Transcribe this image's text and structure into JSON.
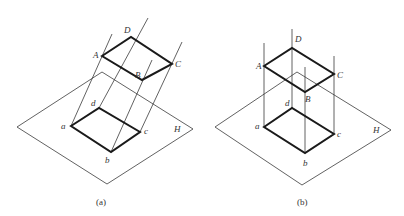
{
  "figures": [
    {
      "id": "a",
      "caption": "(a)",
      "projection": "oblique",
      "plane_label": "H",
      "upper_points": {
        "A": "A",
        "B": "B",
        "C": "C",
        "D": "D"
      },
      "lower_points": {
        "a": "a",
        "b": "b",
        "c": "c",
        "d": "d"
      }
    },
    {
      "id": "b",
      "caption": "(b)",
      "projection": "orthographic",
      "plane_label": "H",
      "upper_points": {
        "A": "A",
        "B": "B",
        "C": "C",
        "D": "D"
      },
      "lower_points": {
        "a": "a",
        "b": "b",
        "c": "c",
        "d": "d"
      }
    }
  ],
  "colors": {
    "line": "#3a3a3a",
    "thick_line": "#1a1a1a",
    "background": "#ffffff"
  }
}
